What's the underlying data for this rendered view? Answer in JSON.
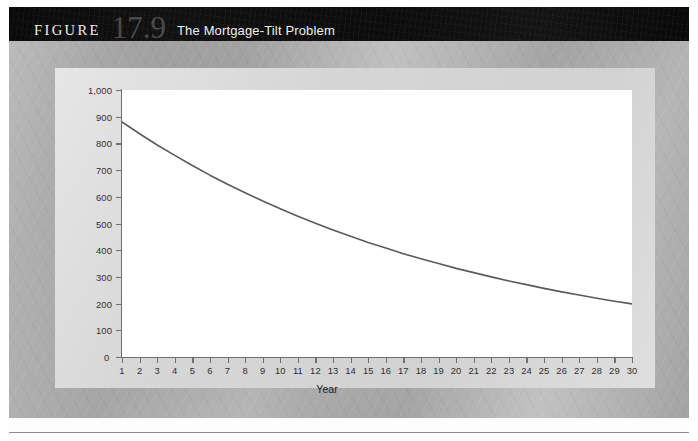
{
  "header": {
    "figure_word": "FIGURE",
    "figure_number": "17.9",
    "title": "The Mortgage-Tilt Problem"
  },
  "chart_data": {
    "type": "line",
    "title": "The Mortgage-Tilt Problem",
    "xlabel": "Year",
    "ylabel": "Real Value of Payment (Dollars)",
    "xlim": [
      1,
      30
    ],
    "ylim": [
      0,
      1000
    ],
    "grid": false,
    "legend": null,
    "y_ticks": [
      "0",
      "100",
      "200",
      "300",
      "400",
      "500",
      "600",
      "700",
      "800",
      "900",
      "1,000"
    ],
    "y_tick_values": [
      0,
      100,
      200,
      300,
      400,
      500,
      600,
      700,
      800,
      900,
      1000
    ],
    "x_ticks": [
      "1",
      "2",
      "3",
      "4",
      "5",
      "6",
      "7",
      "8",
      "9",
      "10",
      "11",
      "12",
      "13",
      "14",
      "15",
      "16",
      "17",
      "18",
      "19",
      "20",
      "21",
      "22",
      "23",
      "24",
      "25",
      "26",
      "27",
      "28",
      "29",
      "30"
    ],
    "x": [
      1,
      2,
      3,
      4,
      5,
      6,
      7,
      8,
      9,
      10,
      11,
      12,
      13,
      14,
      15,
      16,
      17,
      18,
      19,
      20,
      21,
      22,
      23,
      24,
      25,
      26,
      27,
      28,
      29,
      30
    ],
    "values": [
      880,
      836,
      794,
      755,
      717,
      681,
      647,
      615,
      584,
      555,
      527,
      501,
      476,
      452,
      429,
      408,
      387,
      368,
      350,
      332,
      316,
      300,
      285,
      271,
      257,
      244,
      232,
      220,
      209,
      199
    ],
    "series": [
      {
        "name": "Real value of mortgage payment",
        "color": "#5a5a5a",
        "values": [
          880,
          836,
          794,
          755,
          717,
          681,
          647,
          615,
          584,
          555,
          527,
          501,
          476,
          452,
          429,
          408,
          387,
          368,
          350,
          332,
          316,
          300,
          285,
          271,
          257,
          244,
          232,
          220,
          209,
          199
        ]
      }
    ],
    "line_color": "#5a5a5a",
    "line_width": 1.6
  },
  "colors": {
    "header_bar": "#0d0d0d",
    "page_background": "#a9a9a9",
    "panel_background": "#d6d6d6",
    "plot_background": "#ffffff",
    "axis": "#6f6f6f",
    "curve": "#5a5a5a",
    "figure_number": "#4a4a4a",
    "header_text": "#efeeea"
  }
}
